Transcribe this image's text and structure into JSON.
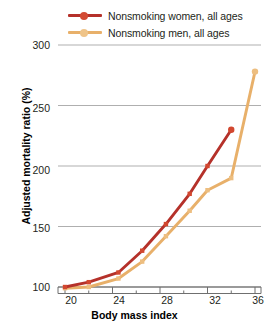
{
  "chart_data": {
    "type": "line",
    "title": "",
    "xlabel": "Body mass index",
    "ylabel": "Adjusted mortality ratio (%)",
    "xlim": [
      19,
      37
    ],
    "ylim": [
      88,
      300
    ],
    "xticks": [
      20,
      24,
      28,
      32,
      36
    ],
    "yticks": [
      100,
      150,
      200,
      250,
      300
    ],
    "xtick_labels": [
      "20",
      "24",
      "28",
      "32",
      "36"
    ],
    "ytick_labels": [
      "100",
      "150",
      "200",
      "250",
      "300"
    ],
    "grid": "horizontal",
    "legend_position": "top-left",
    "series": [
      {
        "name": "Nonsmoking women, all ages",
        "color": "#b5312a",
        "marker": "square",
        "x": [
          20.0,
          22.0,
          24.5,
          26.5,
          28.5,
          30.5,
          32.0,
          34.0
        ],
        "y": [
          100,
          104,
          112,
          130,
          152,
          177,
          200,
          230
        ]
      },
      {
        "name": "Nonsmoking men, all ages",
        "color": "#e8b06a",
        "marker": "square",
        "x": [
          20.0,
          22.0,
          24.5,
          26.5,
          28.5,
          30.5,
          32.0,
          34.0,
          36.0
        ],
        "y": [
          99,
          100,
          107,
          121,
          142,
          163,
          180,
          190,
          278
        ]
      }
    ]
  },
  "legend": {
    "items": [
      {
        "label": "Nonsmoking women, all ages",
        "color": "#b5312a"
      },
      {
        "label": "Nonsmoking men, all ages",
        "color": "#e8b06a"
      }
    ]
  },
  "axes": {
    "y_title": "Adjusted mortality ratio (%)",
    "x_title": "Body mass index",
    "y_labels": [
      "300",
      "250",
      "200",
      "150",
      "100"
    ],
    "x_labels": [
      "20",
      "24",
      "28",
      "32",
      "36"
    ]
  }
}
